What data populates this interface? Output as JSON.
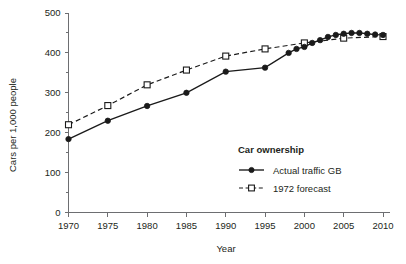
{
  "chart_data": {
    "type": "line",
    "title": "",
    "xlabel": "Year",
    "ylabel": "Cars per 1,000 people",
    "xlim": [
      1970,
      2010
    ],
    "ylim": [
      0,
      500
    ],
    "grid": false,
    "xticks": [
      1970,
      1975,
      1980,
      1985,
      1990,
      1995,
      2000,
      2005,
      2010
    ],
    "xtick_labels": [
      "1970",
      "1975",
      "1980",
      "1985",
      "1990",
      "1995",
      "2000",
      "2005",
      "2010"
    ],
    "yticks": [
      0,
      100,
      200,
      300,
      400,
      500
    ],
    "ytick_labels": [
      "0",
      "100",
      "200",
      "300",
      "400",
      "500"
    ],
    "y_minor_ticks": [
      50,
      150,
      250,
      350,
      450
    ],
    "legend_position": "inside-lower-right",
    "legend_title": "Car ownership",
    "series": [
      {
        "name": "Actual traffic GB",
        "style": "solid",
        "marker": "filled-circle",
        "x": [
          1970,
          1975,
          1980,
          1985,
          1990,
          1995,
          1998,
          1999,
          2000,
          2001,
          2002,
          2003,
          2004,
          2005,
          2006,
          2007,
          2008,
          2009,
          2010
        ],
        "values": [
          184,
          230,
          267,
          300,
          353,
          363,
          400,
          410,
          415,
          425,
          432,
          440,
          445,
          448,
          450,
          450,
          448,
          446,
          445
        ]
      },
      {
        "name": "1972 forecast",
        "style": "dashed",
        "marker": "open-square",
        "x": [
          1970,
          1975,
          1980,
          1985,
          1990,
          1995,
          2000,
          2005,
          2010
        ],
        "values": [
          220,
          268,
          320,
          357,
          392,
          410,
          425,
          437,
          441
        ]
      }
    ]
  },
  "axis": {
    "y_title": "Cars per 1,000 people",
    "x_title": "Year"
  },
  "legend": {
    "title": "Car ownership",
    "entries": [
      {
        "label": "Actual traffic GB",
        "marker": "filled-circle-icon",
        "line": "solid-line-icon"
      },
      {
        "label": "1972 forecast",
        "marker": "open-square-icon",
        "line": "dashed-line-icon"
      }
    ]
  },
  "colors": {
    "ink": "#1a1a1a",
    "axis": "#6d6e71",
    "background": "#ffffff"
  }
}
